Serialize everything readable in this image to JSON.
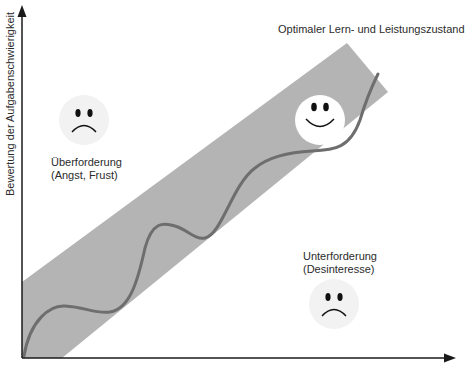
{
  "diagram": {
    "title": "",
    "y_axis_label": "Bewertung der Aufgabenschwierigkeit",
    "x_axis_label": "",
    "zones": {
      "optimal": {
        "label": "Optimaler Lern- und Leistungszustand",
        "face": "happy-face"
      },
      "overload": {
        "line1": "Überforderung",
        "line2": "(Angst, Frust)",
        "face": "sad-face"
      },
      "underload": {
        "line1": "Unterforderung",
        "line2": "(Desinteresse)",
        "face": "sad-face"
      }
    },
    "colors": {
      "band": "#b4b4b4",
      "curve": "#6e6e6e",
      "axis": "#1a1a1a",
      "face_bg": "#f2f2f2",
      "happy_face_bg": "#ffffff"
    }
  }
}
